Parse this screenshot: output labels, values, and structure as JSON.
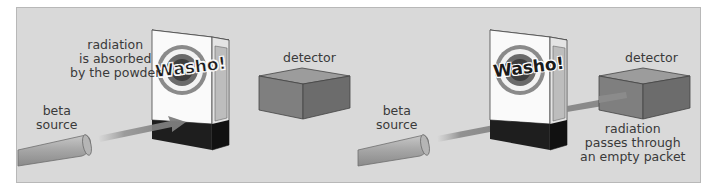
{
  "diagram": {
    "background": "#d9d9d9",
    "left_scenario": {
      "source_label": [
        "beta",
        "source"
      ],
      "packet_brand": "Washo!",
      "packet_note": [
        "radiation",
        "is absorbed",
        "by the powder"
      ],
      "detector_label": "detector"
    },
    "right_scenario": {
      "source_label": [
        "beta",
        "source"
      ],
      "packet_brand": "Washo!",
      "detector_label": "detector",
      "detector_note": [
        "radiation",
        "passes through",
        "an empty packet"
      ]
    }
  }
}
